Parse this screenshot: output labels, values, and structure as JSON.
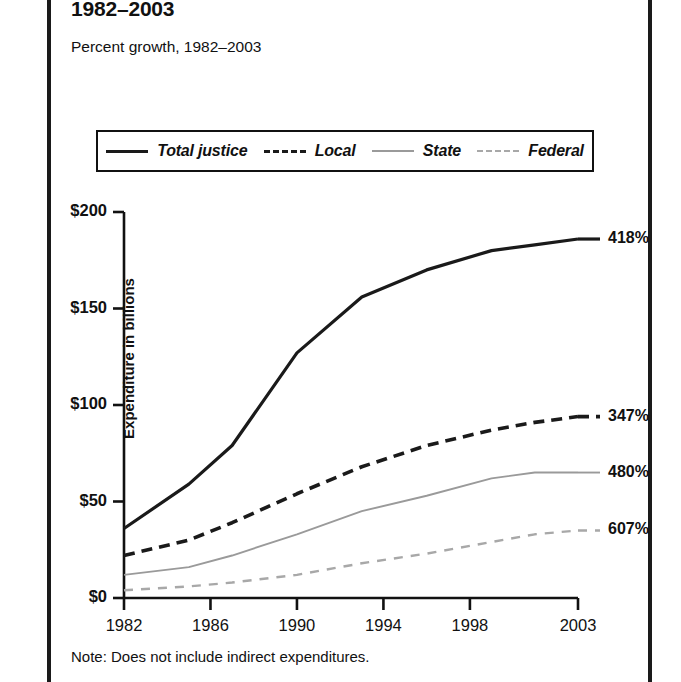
{
  "header": {
    "title": "1982–2003",
    "subtitle": "Percent growth, 1982–2003"
  },
  "note": "Note: Does not include indirect expenditures.",
  "legend": {
    "items": [
      {
        "label": "Total justice",
        "style": "solid-black",
        "key": "total"
      },
      {
        "label": "Local",
        "style": "dashed-black",
        "key": "local"
      },
      {
        "label": "State",
        "style": "solid-gray",
        "key": "state"
      },
      {
        "label": "Federal",
        "style": "dashed-gray",
        "key": "federal"
      }
    ]
  },
  "colors": {
    "total": "#1a1a1a",
    "local": "#1a1a1a",
    "state": "#9a9a9a",
    "federal": "#a8a8a8",
    "axis": "#111111",
    "page_rule": "#1a1a1a",
    "background": "#ffffff"
  },
  "axes": {
    "y_label": "Expenditure in billions",
    "y_ticks": [
      "$0",
      "$50",
      "$100",
      "$150",
      "$200"
    ],
    "x_ticks": [
      "1982",
      "1986",
      "1990",
      "1994",
      "1998",
      "2003"
    ]
  },
  "annotations": [
    {
      "series": "Total justice",
      "text": "418%"
    },
    {
      "series": "Local",
      "text": "347%"
    },
    {
      "series": "State",
      "text": "480%"
    },
    {
      "series": "Federal",
      "text": "607%"
    }
  ],
  "chart_data": {
    "type": "line",
    "title": "1982–2003",
    "subtitle": "Percent growth, 1982–2003",
    "xlabel": "",
    "ylabel": "Expenditure in billions",
    "xlim": [
      1982,
      2003
    ],
    "ylim": [
      0,
      200
    ],
    "ytick_values": [
      0,
      50,
      100,
      150,
      200
    ],
    "ytick_labels": [
      "$0",
      "$50",
      "$100",
      "$150",
      "$200"
    ],
    "xtick_values": [
      1982,
      1986,
      1990,
      1994,
      1998,
      2003
    ],
    "xtick_labels": [
      "1982",
      "1986",
      "1990",
      "1994",
      "1998",
      "2003"
    ],
    "grid": false,
    "legend_position": "above-plot",
    "x": [
      1982,
      1985,
      1987,
      1990,
      1993,
      1996,
      1999,
      2001,
      2003
    ],
    "series": [
      {
        "name": "Total justice",
        "style": "solid",
        "color": "#1a1a1a",
        "growth_label": "418%",
        "values": [
          36,
          59,
          79,
          127,
          156,
          170,
          180,
          183,
          186
        ]
      },
      {
        "name": "Local",
        "style": "dashed",
        "color": "#1a1a1a",
        "growth_label": "347%",
        "values": [
          22,
          30,
          39,
          54,
          68,
          79,
          87,
          91,
          94
        ]
      },
      {
        "name": "State",
        "style": "solid",
        "color": "#9a9a9a",
        "growth_label": "480%",
        "values": [
          12,
          16,
          22,
          33,
          45,
          53,
          62,
          65,
          65
        ]
      },
      {
        "name": "Federal",
        "style": "dashed",
        "color": "#a8a8a8",
        "growth_label": "607%",
        "values": [
          4,
          6,
          8,
          12,
          18,
          23,
          29,
          33,
          35
        ]
      }
    ]
  }
}
